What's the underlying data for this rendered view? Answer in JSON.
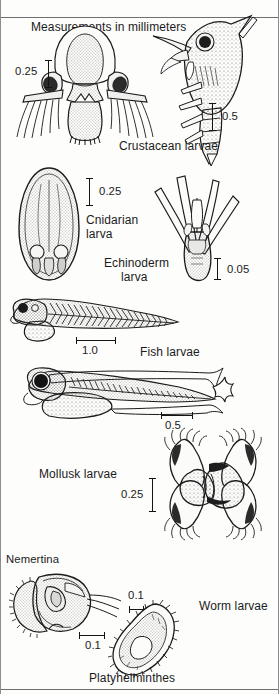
{
  "plate": {
    "title": "Measurements in millimeters",
    "unit": "mm",
    "background_color": "#fdfdfc",
    "ink_color": "#1b1b1b",
    "width": 279,
    "height": 694
  },
  "groups": [
    {
      "id": "crustacean",
      "label": "Crustacean larvae",
      "figures": [
        {
          "id": "nauplius",
          "name": "crustacean-nauplius-larva",
          "scale_label": "0.25",
          "scale_orientation": "vertical"
        },
        {
          "id": "zoea",
          "name": "crustacean-zoea-larva",
          "scale_label": "0.5",
          "scale_orientation": "vertical"
        }
      ]
    },
    {
      "id": "cnidarian",
      "label": "Cnidarian larva",
      "label_line_1": "Cnidarian",
      "label_line_2": "larva",
      "figures": [
        {
          "id": "planula",
          "name": "cnidarian-planula-larva",
          "scale_label": "0.25",
          "scale_orientation": "vertical"
        }
      ]
    },
    {
      "id": "echinoderm",
      "label": "Echinoderm larva",
      "label_line_1": "Echinoderm",
      "label_line_2": "larva",
      "figures": [
        {
          "id": "pluteus",
          "name": "echinoderm-pluteus-larva",
          "scale_label": "0.05",
          "scale_orientation": "vertical"
        }
      ]
    },
    {
      "id": "fish",
      "label": "Fish larvae",
      "figures": [
        {
          "id": "fish-upper",
          "name": "fish-larva-yolksac",
          "scale_label": "1.0",
          "scale_orientation": "horizontal"
        },
        {
          "id": "fish-lower",
          "name": "fish-larva-postflexion",
          "scale_label": "0.5",
          "scale_orientation": "horizontal"
        }
      ]
    },
    {
      "id": "mollusk",
      "label": "Mollusk larvae",
      "figures": [
        {
          "id": "veliger",
          "name": "mollusk-veliger-larva",
          "scale_label": "0.25",
          "scale_orientation": "vertical"
        }
      ]
    },
    {
      "id": "worm",
      "label": "Worm larvae",
      "figures": [
        {
          "id": "pilidium",
          "name": "nemertina-pilidium-larva",
          "taxon_label": "Nemertina",
          "scale_label": "0.1",
          "scale_orientation": "horizontal"
        },
        {
          "id": "muller",
          "name": "platyhelminthes-muller-larva",
          "taxon_label": "Platyhelminthes",
          "scale_label": "0.1",
          "scale_orientation": "horizontal"
        }
      ]
    }
  ],
  "labels": {
    "title": "Measurements in millimeters",
    "crustacean": "Crustacean larvae",
    "cnidarian_1": "Cnidarian",
    "cnidarian_2": "larva",
    "echinoderm_1": "Echinoderm",
    "echinoderm_2": "larva",
    "fish": "Fish larvae",
    "mollusk": "Mollusk larvae",
    "nemertina": "Nemertina",
    "platyhelminthes": "Platyhelminthes",
    "worm": "Worm larvae"
  },
  "scales": {
    "nauplius": "0.25",
    "zoea": "0.5",
    "planula": "0.25",
    "pluteus": "0.05",
    "fish_upper": "1.0",
    "fish_lower": "0.5",
    "veliger": "0.25",
    "pilidium": "0.1",
    "muller": "0.1"
  }
}
